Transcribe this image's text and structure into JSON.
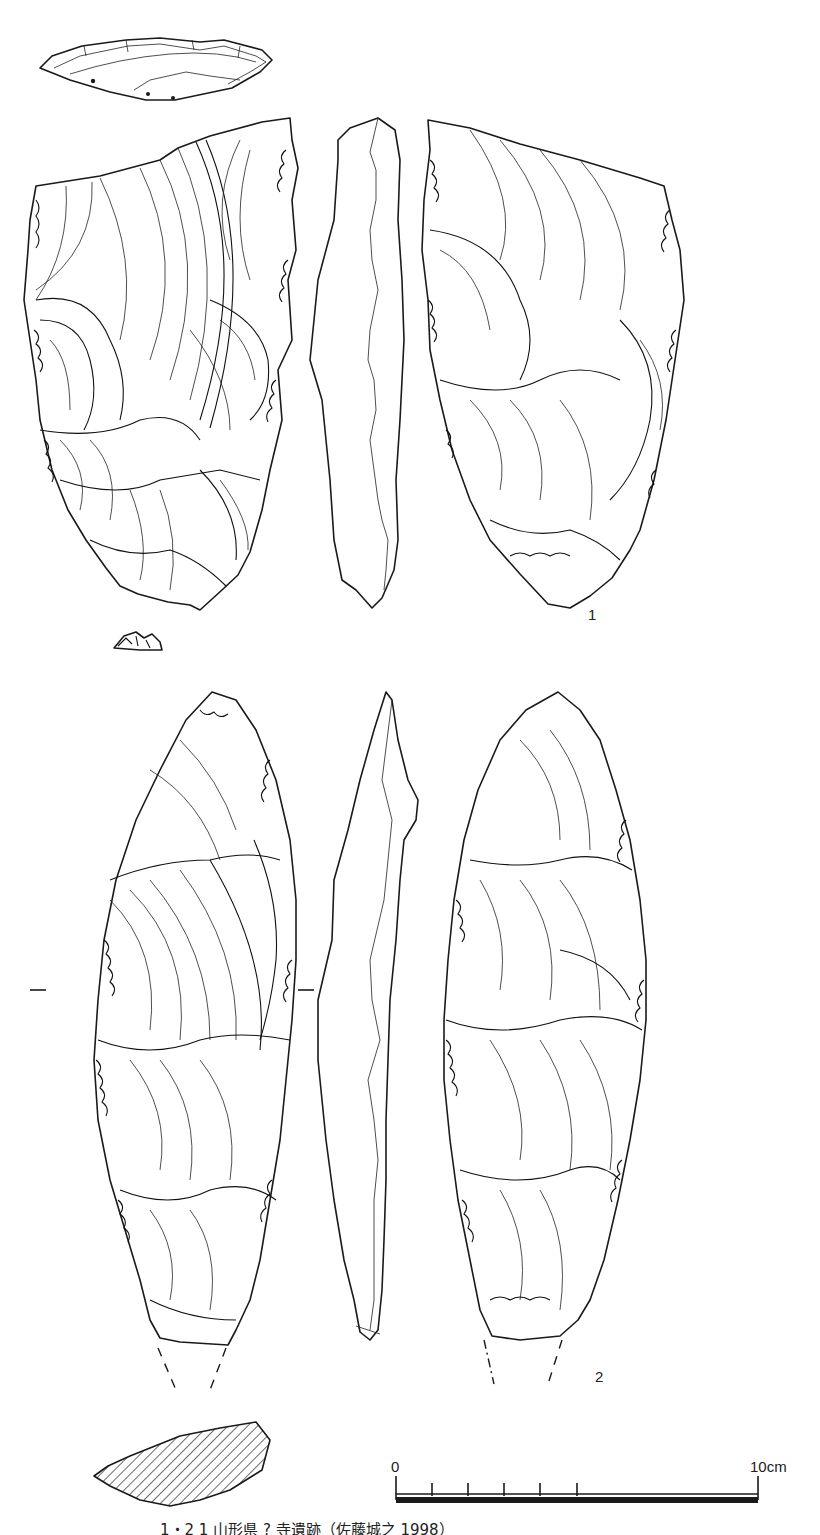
{
  "figure": {
    "artifacts": [
      {
        "number_label": "1",
        "views": [
          "platform-view",
          "dorsal-face",
          "lateral-profile",
          "ventral-face",
          "basal-fragment"
        ]
      },
      {
        "number_label": "2",
        "views": [
          "dorsal-face",
          "lateral-profile",
          "ventral-face",
          "cross-section"
        ]
      }
    ],
    "scale_bar": {
      "start_label": "0",
      "end_label": "10cm",
      "tick_count": 6
    },
    "caption": "1・2 1 山形県 ? 寺遺跡（佐藤城之 1998）",
    "colors": {
      "ink": "#1a1a1a",
      "paper": "#ffffff"
    }
  }
}
